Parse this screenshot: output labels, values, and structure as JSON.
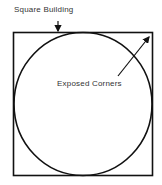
{
  "diagram": {
    "labels": {
      "building": "Square Building",
      "corners": "Exposed Corners"
    },
    "colors": {
      "stroke": "#111111",
      "text": "#333333",
      "background": "#ffffff"
    }
  }
}
